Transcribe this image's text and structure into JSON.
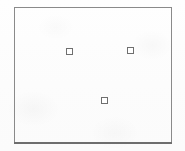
{
  "figure": {
    "title": "",
    "canvas_width": 185,
    "canvas_height": 151,
    "background_color": "#fdfdfd",
    "frame": {
      "name": "plot-frame",
      "x": 14,
      "y": 7,
      "width": 158,
      "height": 137,
      "stroke_color": "#8a8a8a",
      "bottom_stroke_color": "#6e6e6e",
      "stroke_width": 1,
      "fill": "none"
    },
    "markers": {
      "shape": "square-outline",
      "size": 7,
      "stroke_color": "#6f6f6f",
      "fill_color": "#ffffff",
      "count": 3,
      "items": [
        {
          "label": "",
          "name": "point-marker-1",
          "cx": 69,
          "cy": 51
        },
        {
          "label": "",
          "name": "point-marker-2",
          "cx": 130,
          "cy": 50
        },
        {
          "label": "",
          "name": "point-marker-3",
          "cx": 104,
          "cy": 100
        }
      ]
    },
    "labels": [],
    "axes": {
      "ticks_visible": false,
      "tick_labels": [],
      "axis_titles": []
    }
  },
  "chart_data": {
    "type": "scatter",
    "title": "",
    "xlabel": "",
    "ylabel": "",
    "grid": false,
    "legend": false,
    "legend_position": "none",
    "frame_only": true,
    "xlim": [
      14,
      172
    ],
    "ylim": [
      7,
      144
    ],
    "series": [
      {
        "name": "points",
        "marker": "square-open",
        "color": "#6f6f6f",
        "points": [
          {
            "x": 69,
            "y": 51
          },
          {
            "x": 130,
            "y": 50
          },
          {
            "x": 104,
            "y": 100
          }
        ]
      }
    ],
    "annotations": []
  }
}
